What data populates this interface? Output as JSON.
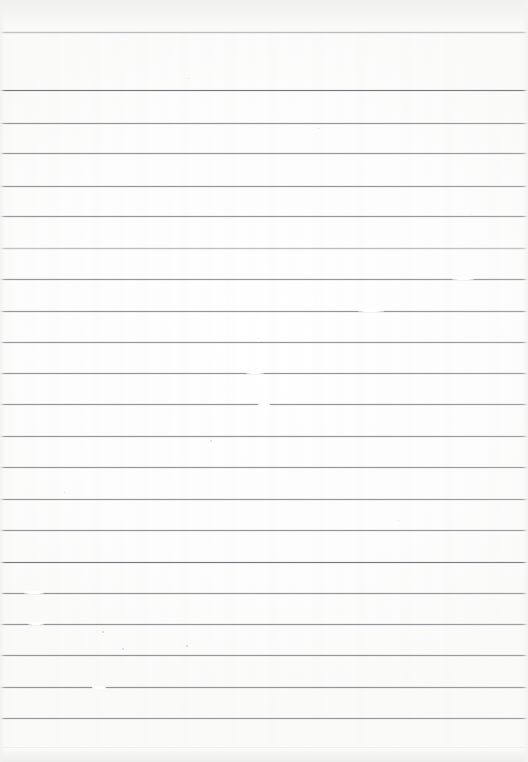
{
  "document": {
    "kind": "scanned-lined-paper",
    "title": "Blank Ruled Notebook Page",
    "content_text": "",
    "width_px": 528,
    "height_px": 762,
    "page_color": "#fdfdfc",
    "rule_color": "#8c8e92",
    "rule_color_dark": "#747579",
    "rule_color_light": "#a2a4a7",
    "edge_tint_color": "#f1f1ef",
    "rule_count": 24,
    "rule_spacing_px": 31.3,
    "first_rule_y": 32,
    "margin_rule": "none",
    "handwriting": "none"
  },
  "rules": [
    {
      "y": 32,
      "weight": "light"
    },
    {
      "y": 90,
      "weight": "dark"
    },
    {
      "y": 123,
      "weight": "normal"
    },
    {
      "y": 153,
      "weight": "normal"
    },
    {
      "y": 186,
      "weight": "normal"
    },
    {
      "y": 216,
      "weight": "normal"
    },
    {
      "y": 248,
      "weight": "light"
    },
    {
      "y": 279,
      "weight": "normal"
    },
    {
      "y": 311,
      "weight": "normal"
    },
    {
      "y": 342,
      "weight": "normal"
    },
    {
      "y": 373,
      "weight": "normal"
    },
    {
      "y": 404,
      "weight": "normal"
    },
    {
      "y": 436,
      "weight": "normal"
    },
    {
      "y": 467,
      "weight": "normal"
    },
    {
      "y": 499,
      "weight": "normal"
    },
    {
      "y": 530,
      "weight": "normal"
    },
    {
      "y": 562,
      "weight": "dark"
    },
    {
      "y": 593,
      "weight": "normal"
    },
    {
      "y": 624,
      "weight": "normal"
    },
    {
      "y": 655,
      "weight": "normal"
    },
    {
      "y": 687,
      "weight": "normal"
    },
    {
      "y": 718,
      "weight": "normal"
    },
    {
      "y": 748,
      "weight": "dark"
    }
  ],
  "artifacts": {
    "line_gaps": [
      {
        "x": 452,
        "y": 277,
        "w": 22
      },
      {
        "x": 358,
        "y": 309,
        "w": 26
      },
      {
        "x": 246,
        "y": 371,
        "w": 18
      },
      {
        "x": 24,
        "y": 591,
        "w": 20
      },
      {
        "x": 28,
        "y": 622,
        "w": 16
      },
      {
        "x": 92,
        "y": 686,
        "w": 14
      },
      {
        "x": 258,
        "y": 403,
        "w": 12
      }
    ],
    "specks": [
      {
        "x": 210,
        "y": 440,
        "d": 2.0
      },
      {
        "x": 122,
        "y": 648,
        "d": 1.8
      },
      {
        "x": 186,
        "y": 645,
        "d": 1.6
      },
      {
        "x": 102,
        "y": 631,
        "d": 1.5
      },
      {
        "x": 318,
        "y": 128,
        "d": 1.4
      },
      {
        "x": 470,
        "y": 214,
        "d": 1.3
      },
      {
        "x": 188,
        "y": 78,
        "d": 1.3
      },
      {
        "x": 398,
        "y": 520,
        "d": 1.4
      },
      {
        "x": 258,
        "y": 338,
        "d": 1.2
      },
      {
        "x": 64,
        "y": 492,
        "d": 1.3
      }
    ]
  }
}
